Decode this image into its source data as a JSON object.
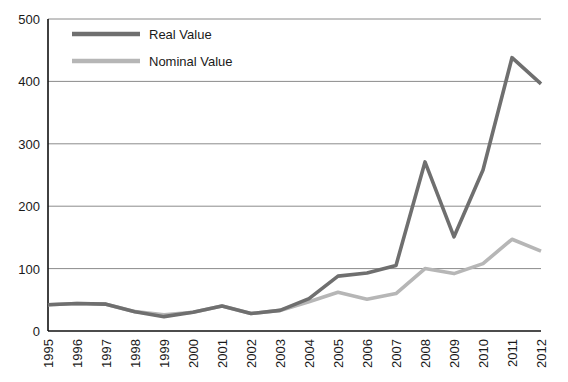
{
  "chart_data": {
    "type": "line",
    "title": "",
    "xlabel": "",
    "ylabel": "",
    "grid": "horizontal",
    "legend_position": "top-left-inside",
    "x": [
      1995,
      1996,
      1997,
      1998,
      1999,
      2000,
      2001,
      2002,
      2003,
      2004,
      2005,
      2006,
      2007,
      2008,
      2009,
      2010,
      2011,
      2012
    ],
    "categories": [
      "1995",
      "1996",
      "1997",
      "1998",
      "1999",
      "2000",
      "2001",
      "2002",
      "2003",
      "2004",
      "2005",
      "2006",
      "2007",
      "2008",
      "2009",
      "2010",
      "2011",
      "2012"
    ],
    "xlim": [
      1995,
      2012
    ],
    "ylim": [
      0,
      500
    ],
    "yticks": [
      0,
      100,
      200,
      300,
      400,
      500
    ],
    "ytick_labels": [
      "0",
      "100",
      "200",
      "300",
      "400",
      "500"
    ],
    "series": [
      {
        "name": "Real Value",
        "color": "#6f6f6f",
        "values": [
          42,
          44,
          43,
          31,
          23,
          30,
          40,
          28,
          33,
          52,
          88,
          93,
          105,
          271,
          151,
          258,
          438,
          396
        ]
      },
      {
        "name": "Nominal Value",
        "color": "#b6b6b6",
        "values": [
          42,
          44,
          43,
          31,
          26,
          30,
          40,
          28,
          33,
          47,
          62,
          51,
          60,
          100,
          92,
          108,
          147,
          128
        ]
      }
    ]
  },
  "legend": {
    "entries": [
      {
        "label": "Real Value"
      },
      {
        "label": "Nominal Value"
      }
    ]
  },
  "axes": {
    "y_axis_name": "value-axis",
    "x_axis_name": "year-axis"
  },
  "colors": {
    "real": "#6f6f6f",
    "nominal": "#b6b6b6",
    "grid": "#6d6d6d",
    "axis": "#111111",
    "text": "#1a1a1a",
    "background": "#ffffff"
  }
}
